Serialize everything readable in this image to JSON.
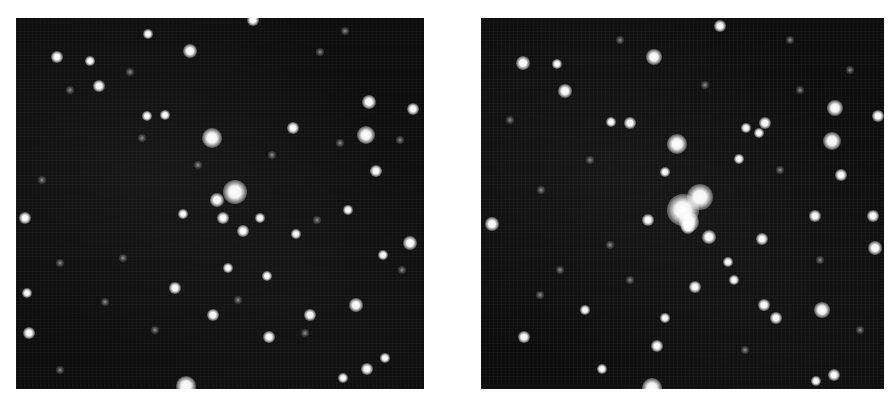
{
  "figure": {
    "panels": [
      {
        "id": "left",
        "label": "",
        "description": "Star field, earlier epoch",
        "origin": [
          16,
          18
        ],
        "stars": [
          {
            "x": 190,
            "y": 51,
            "r": 6
          },
          {
            "x": 253,
            "y": 20,
            "r": 5
          },
          {
            "x": 212,
            "y": 138,
            "r": 9
          },
          {
            "x": 235,
            "y": 192,
            "r": 11
          },
          {
            "x": 217,
            "y": 200,
            "r": 6
          },
          {
            "x": 223,
            "y": 218,
            "r": 5
          },
          {
            "x": 243,
            "y": 231,
            "r": 5
          },
          {
            "x": 99,
            "y": 86,
            "r": 5
          },
          {
            "x": 57,
            "y": 57,
            "r": 5
          },
          {
            "x": 90,
            "y": 61,
            "r": 4
          },
          {
            "x": 148,
            "y": 34,
            "r": 4
          },
          {
            "x": 165,
            "y": 115,
            "r": 4
          },
          {
            "x": 147,
            "y": 116,
            "r": 4
          },
          {
            "x": 369,
            "y": 102,
            "r": 6
          },
          {
            "x": 413,
            "y": 109,
            "r": 5
          },
          {
            "x": 366,
            "y": 135,
            "r": 8
          },
          {
            "x": 376,
            "y": 171,
            "r": 5
          },
          {
            "x": 293,
            "y": 128,
            "r": 5
          },
          {
            "x": 25,
            "y": 218,
            "r": 5
          },
          {
            "x": 348,
            "y": 210,
            "r": 4
          },
          {
            "x": 410,
            "y": 243,
            "r": 6
          },
          {
            "x": 356,
            "y": 305,
            "r": 6
          },
          {
            "x": 310,
            "y": 315,
            "r": 5
          },
          {
            "x": 269,
            "y": 337,
            "r": 5
          },
          {
            "x": 213,
            "y": 315,
            "r": 5
          },
          {
            "x": 175,
            "y": 288,
            "r": 5
          },
          {
            "x": 228,
            "y": 268,
            "r": 4
          },
          {
            "x": 267,
            "y": 276,
            "r": 4
          },
          {
            "x": 383,
            "y": 255,
            "r": 4
          },
          {
            "x": 27,
            "y": 293,
            "r": 4
          },
          {
            "x": 29,
            "y": 333,
            "r": 5
          },
          {
            "x": 186,
            "y": 386,
            "r": 9
          },
          {
            "x": 367,
            "y": 369,
            "r": 5
          },
          {
            "x": 343,
            "y": 378,
            "r": 4
          },
          {
            "x": 385,
            "y": 358,
            "r": 4
          },
          {
            "x": 296,
            "y": 234,
            "r": 4
          },
          {
            "x": 260,
            "y": 218,
            "r": 4
          },
          {
            "x": 183,
            "y": 214,
            "r": 4
          },
          {
            "x": 320,
            "y": 52,
            "r": 3,
            "faint": true
          },
          {
            "x": 345,
            "y": 31,
            "r": 3,
            "faint": true
          },
          {
            "x": 42,
            "y": 180,
            "r": 3,
            "faint": true
          },
          {
            "x": 60,
            "y": 263,
            "r": 3,
            "faint": true
          },
          {
            "x": 105,
            "y": 302,
            "r": 3,
            "faint": true
          },
          {
            "x": 123,
            "y": 258,
            "r": 3,
            "faint": true
          },
          {
            "x": 155,
            "y": 330,
            "r": 3,
            "faint": true
          },
          {
            "x": 198,
            "y": 165,
            "r": 3,
            "faint": true
          },
          {
            "x": 272,
            "y": 155,
            "r": 3,
            "faint": true
          },
          {
            "x": 317,
            "y": 220,
            "r": 3,
            "faint": true
          },
          {
            "x": 340,
            "y": 143,
            "r": 3,
            "faint": true
          },
          {
            "x": 400,
            "y": 140,
            "r": 3,
            "faint": true
          },
          {
            "x": 70,
            "y": 90,
            "r": 3,
            "faint": true
          },
          {
            "x": 130,
            "y": 72,
            "r": 3,
            "faint": true
          },
          {
            "x": 238,
            "y": 300,
            "r": 3,
            "faint": true
          },
          {
            "x": 305,
            "y": 333,
            "r": 3,
            "faint": true
          },
          {
            "x": 402,
            "y": 270,
            "r": 3,
            "faint": true
          },
          {
            "x": 60,
            "y": 370,
            "r": 3,
            "faint": true
          },
          {
            "x": 142,
            "y": 138,
            "r": 3,
            "faint": true
          }
        ]
      },
      {
        "id": "right",
        "label": "",
        "description": "Star field, later epoch with brightened central source",
        "origin": [
          481,
          18
        ],
        "stars": [
          {
            "x": 654,
            "y": 57,
            "r": 7
          },
          {
            "x": 720,
            "y": 26,
            "r": 5
          },
          {
            "x": 523,
            "y": 63,
            "r": 6
          },
          {
            "x": 557,
            "y": 64,
            "r": 4
          },
          {
            "x": 565,
            "y": 91,
            "r": 6
          },
          {
            "x": 630,
            "y": 123,
            "r": 5
          },
          {
            "x": 611,
            "y": 122,
            "r": 4
          },
          {
            "x": 677,
            "y": 144,
            "r": 9
          },
          {
            "x": 765,
            "y": 123,
            "r": 5
          },
          {
            "x": 746,
            "y": 128,
            "r": 4
          },
          {
            "x": 835,
            "y": 108,
            "r": 7
          },
          {
            "x": 878,
            "y": 116,
            "r": 5
          },
          {
            "x": 832,
            "y": 141,
            "r": 8
          },
          {
            "x": 759,
            "y": 133,
            "r": 4
          },
          {
            "x": 739,
            "y": 159,
            "r": 4
          },
          {
            "x": 841,
            "y": 175,
            "r": 5
          },
          {
            "x": 665,
            "y": 172,
            "r": 4
          },
          {
            "x": 683,
            "y": 210,
            "r": 15
          },
          {
            "x": 700,
            "y": 197,
            "r": 12
          },
          {
            "x": 689,
            "y": 222,
            "r": 9
          },
          {
            "x": 688,
            "y": 227,
            "r": 6
          },
          {
            "x": 709,
            "y": 237,
            "r": 6
          },
          {
            "x": 648,
            "y": 220,
            "r": 5
          },
          {
            "x": 492,
            "y": 224,
            "r": 6
          },
          {
            "x": 815,
            "y": 216,
            "r": 5
          },
          {
            "x": 873,
            "y": 216,
            "r": 5
          },
          {
            "x": 875,
            "y": 248,
            "r": 6
          },
          {
            "x": 762,
            "y": 239,
            "r": 5
          },
          {
            "x": 728,
            "y": 262,
            "r": 4
          },
          {
            "x": 734,
            "y": 280,
            "r": 4
          },
          {
            "x": 764,
            "y": 305,
            "r": 5
          },
          {
            "x": 822,
            "y": 310,
            "r": 7
          },
          {
            "x": 776,
            "y": 318,
            "r": 5
          },
          {
            "x": 695,
            "y": 287,
            "r": 5
          },
          {
            "x": 524,
            "y": 337,
            "r": 5
          },
          {
            "x": 657,
            "y": 346,
            "r": 5
          },
          {
            "x": 665,
            "y": 318,
            "r": 4
          },
          {
            "x": 602,
            "y": 369,
            "r": 4
          },
          {
            "x": 652,
            "y": 388,
            "r": 9
          },
          {
            "x": 834,
            "y": 375,
            "r": 5
          },
          {
            "x": 816,
            "y": 381,
            "r": 4
          },
          {
            "x": 585,
            "y": 310,
            "r": 4
          },
          {
            "x": 541,
            "y": 190,
            "r": 3,
            "faint": true
          },
          {
            "x": 590,
            "y": 160,
            "r": 3,
            "faint": true
          },
          {
            "x": 560,
            "y": 270,
            "r": 3,
            "faint": true
          },
          {
            "x": 610,
            "y": 245,
            "r": 3,
            "faint": true
          },
          {
            "x": 800,
            "y": 90,
            "r": 3,
            "faint": true
          },
          {
            "x": 850,
            "y": 70,
            "r": 3,
            "faint": true
          },
          {
            "x": 780,
            "y": 170,
            "r": 3,
            "faint": true
          },
          {
            "x": 820,
            "y": 260,
            "r": 3,
            "faint": true
          },
          {
            "x": 860,
            "y": 330,
            "r": 3,
            "faint": true
          },
          {
            "x": 510,
            "y": 120,
            "r": 3,
            "faint": true
          },
          {
            "x": 540,
            "y": 295,
            "r": 3,
            "faint": true
          },
          {
            "x": 630,
            "y": 280,
            "r": 3,
            "faint": true
          },
          {
            "x": 745,
            "y": 350,
            "r": 3,
            "faint": true
          },
          {
            "x": 705,
            "y": 85,
            "r": 3,
            "faint": true
          },
          {
            "x": 620,
            "y": 40,
            "r": 3,
            "faint": true
          },
          {
            "x": 790,
            "y": 40,
            "r": 3,
            "faint": true
          }
        ]
      }
    ]
  },
  "colors": {
    "background": "#ffffff",
    "sky": "#0d0d0d",
    "star": "#ffffff"
  }
}
